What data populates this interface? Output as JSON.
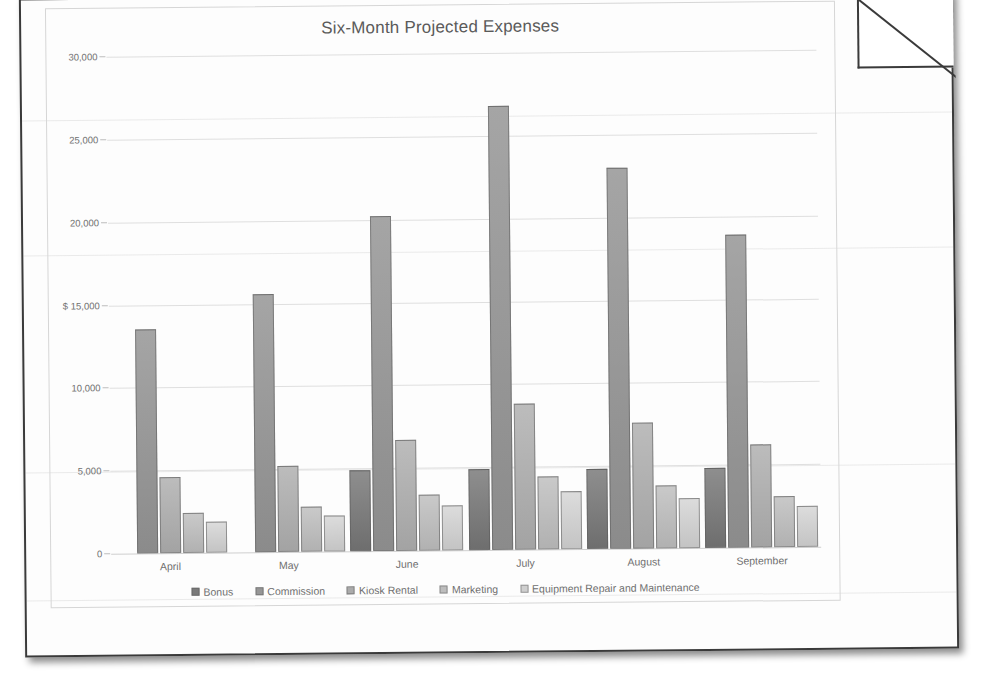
{
  "page": {
    "fold_corner": "folded-corner"
  },
  "chart_data": {
    "type": "bar",
    "title": "Six-Month Projected Expenses",
    "xlabel": "",
    "ylabel": "$",
    "ylim": [
      0,
      30000
    ],
    "grid": true,
    "legend_position": "bottom",
    "categories": [
      "April",
      "May",
      "June",
      "July",
      "August",
      "September"
    ],
    "ytick_labels": [
      "0",
      "5,000",
      "10,000",
      "$ 15,000",
      "20,000",
      "25,000",
      "30,000"
    ],
    "ytick_values": [
      0,
      5000,
      10000,
      15000,
      20000,
      25000,
      30000
    ],
    "series": [
      {
        "name": "Bonus",
        "values": [
          0,
          0,
          4900,
          4900,
          4800,
          4800
        ]
      },
      {
        "name": "Commission",
        "values": [
          13500,
          15600,
          20200,
          26800,
          23000,
          18900
        ]
      },
      {
        "name": "Kiosk Rental",
        "values": [
          4600,
          5200,
          6700,
          8800,
          7600,
          6200
        ]
      },
      {
        "name": "Marketing",
        "values": [
          2400,
          2700,
          3400,
          4400,
          3800,
          3100
        ]
      },
      {
        "name": "Equipment Repair and Maintenance",
        "values": [
          1900,
          2200,
          2700,
          3500,
          3000,
          2500
        ]
      }
    ],
    "colors": [
      "#7a7a7a",
      "#969696",
      "#ababab",
      "#bdbdbd",
      "#cfcfcf"
    ]
  }
}
